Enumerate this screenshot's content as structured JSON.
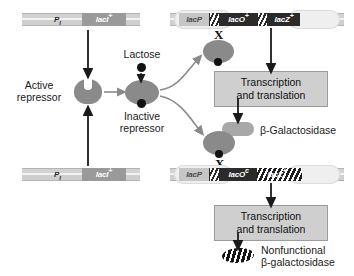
{
  "diagram": {
    "genes": {
      "regulator_promoter": "P",
      "regulator_promoter_sub": "I",
      "regulator": "lacI",
      "regulator_sup": "+",
      "lac_promoter": "lacP",
      "operator_wt": "lacO",
      "operator_wt_sup": "+",
      "operator_mut": "lacO",
      "operator_mut_sup": "c",
      "structural_wt": "lacZ",
      "structural_wt_sup": "+",
      "structural_mut": "lacZ",
      "structural_mut_sup": "+"
    },
    "labels": {
      "lactose": "Lactose",
      "active_repressor": "Active\nrepressor",
      "active_repressor_l1": "Active",
      "active_repressor_l2": "repressor",
      "inactive_repressor_l1": "Inactive",
      "inactive_repressor_l2": "repressor",
      "transcription_l1": "Transcription",
      "transcription_l2": "and translation",
      "beta_gal": "β-Galactosidase",
      "nonfunctional_l1": "Nonfunctional",
      "nonfunctional_l2": "β-galactosidase",
      "x_mark": "X"
    },
    "colors": {
      "protein_gray": "#8a8a8a",
      "dna_gray": "#d2d2d2",
      "gene_dark": "#2b2b2b",
      "box_fill": "#cfcfcf",
      "ligand_black": "#121212",
      "background": "#ffffff"
    }
  }
}
